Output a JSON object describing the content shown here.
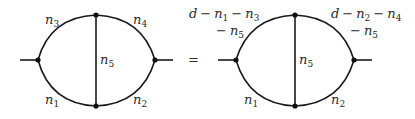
{
  "equation": {
    "operator": "=",
    "lhs": {
      "name": "two-loop self-energy diagram",
      "labels": {
        "top_left": {
          "var": "n",
          "sub": "3"
        },
        "top_right": {
          "var": "n",
          "sub": "4"
        },
        "middle": {
          "var": "n",
          "sub": "5"
        },
        "bottom_left": {
          "var": "n",
          "sub": "1"
        },
        "bottom_right": {
          "var": "n",
          "sub": "2"
        }
      }
    },
    "rhs": {
      "name": "transformed two-loop diagram",
      "labels": {
        "top_left_line1": {
          "d": "d",
          "minus": "−",
          "n_a": "n",
          "sub_a": "1",
          "n_b": "n",
          "sub_b": "3"
        },
        "top_left_line2": {
          "minus": "−",
          "n": "n",
          "sub": "5"
        },
        "top_right_line1": {
          "d": "d",
          "minus": "−",
          "n_a": "n",
          "sub_a": "2",
          "n_b": "n",
          "sub_b": "4"
        },
        "top_right_line2": {
          "minus": "−",
          "n": "n",
          "sub": "5"
        },
        "middle": {
          "var": "n",
          "sub": "5"
        },
        "bottom_left": {
          "var": "n",
          "sub": "1"
        },
        "bottom_right": {
          "var": "n",
          "sub": "2"
        }
      }
    }
  },
  "colors": {
    "line": "#1a1a1a",
    "text": "#2a2a2a",
    "background": "#ffffff"
  }
}
